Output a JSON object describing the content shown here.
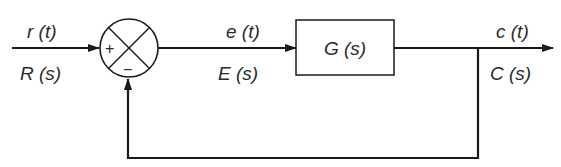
{
  "diagram": {
    "type": "feedback-control-block-diagram",
    "input": {
      "time_label": "r (t)",
      "laplace_label": "R (s)"
    },
    "summing_junction": {
      "plus_sign": "+",
      "minus_sign": "−"
    },
    "error": {
      "time_label": "e (t)",
      "laplace_label": "E (s)"
    },
    "plant": {
      "label": "G (s)"
    },
    "output": {
      "time_label": "c (t)",
      "laplace_label": "C (s)"
    }
  }
}
